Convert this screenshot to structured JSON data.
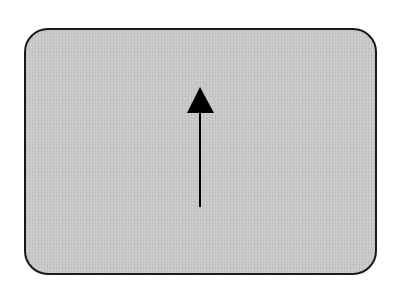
{
  "diagram": {
    "shape": "rounded-rectangle",
    "fill_color": "#c9c9c9",
    "border_color": "#1a1a1a",
    "arrow": {
      "direction": "up",
      "color": "#000000",
      "tip": [
        200,
        87
      ],
      "tail": [
        200,
        207
      ]
    }
  }
}
